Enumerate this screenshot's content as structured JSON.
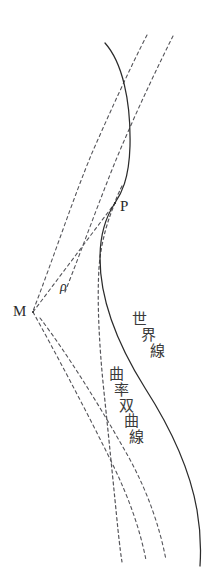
{
  "figure": {
    "background_color": "#ffffff",
    "stroke_color": "#2b2b2b",
    "dash_color": "#55555a",
    "width": 221,
    "height": 586
  },
  "labels": {
    "point_p": "P",
    "point_m": "M",
    "radius_rho": "ρ",
    "world_line": "世界線",
    "world_line_chars": [
      "世",
      "界",
      "線"
    ],
    "curvature_hyperbola": "曲率双曲線",
    "curvature_hyperbola_chars": [
      "曲",
      "率",
      "双",
      "曲",
      "線"
    ]
  },
  "geometry": {
    "world_line_path": "M 105,43 C 122,62 131,100 130,146 C 129,180 121,194 115,203 C 107,215 100,232 100,258 C 100,300 118,345 145,388 C 172,430 190,470 197,510 C 201,533 201,551 200,566",
    "curvature_hyperbola_path": "M 122,186 C 118,194 116,199 115,203 C 109,217 101,240 99,268 C 97,300 99,345 104,392 C 109,440 114,490 118,530 C 120,548 121,556 122,562",
    "asymptote_left_path": "M 147,35 C 130,68 110,112 92,153 C 74,196 52,262 33,311",
    "asymptote_right_path": "M 173,36 C 158,66 140,104 124,141 C 106,182 84,244 65,292",
    "ray_to_p_path": "M 33,312 L 115,203",
    "ray_down_left_path": "M 33,312 C 54,350 86,410 112,463 C 130,500 140,530 146,560",
    "ray_down_right_path": "M 40,318 C 66,352 100,406 128,456 C 148,492 160,528 166,560",
    "point_p": [
      115,
      203
    ],
    "point_m": [
      33,
      312
    ],
    "tangency_point": [
      115,
      203
    ],
    "upper_crossing_point": [
      128,
      92
    ]
  }
}
